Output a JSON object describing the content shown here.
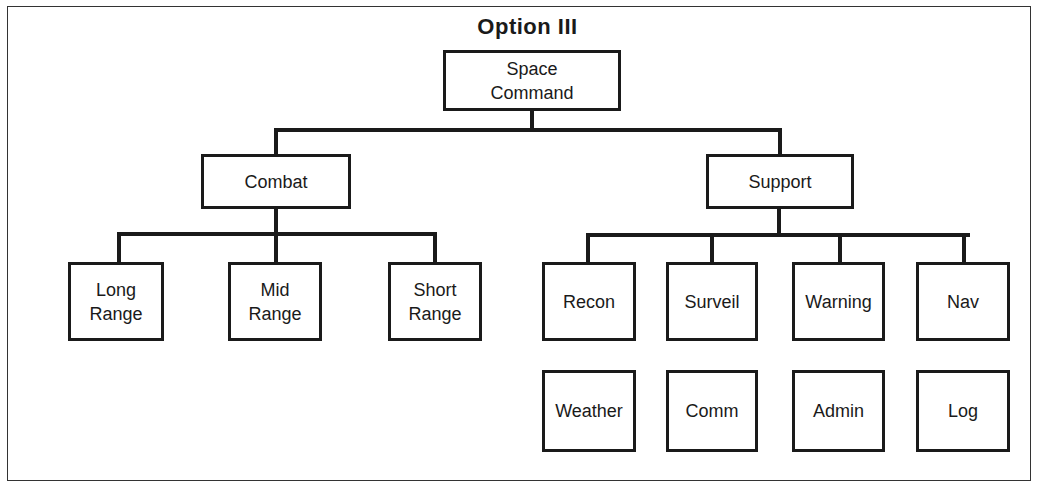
{
  "title": "Option III",
  "root": {
    "label_line1": "Space",
    "label_line2": "Command"
  },
  "branches": {
    "combat": {
      "label": "Combat",
      "children": [
        {
          "line1": "Long",
          "line2": "Range"
        },
        {
          "line1": "Mid",
          "line2": "Range"
        },
        {
          "line1": "Short",
          "line2": "Range"
        }
      ]
    },
    "support": {
      "label": "Support",
      "row1": [
        "Recon",
        "Surveil",
        "Warning",
        "Nav"
      ],
      "row2": [
        "Weather",
        "Comm",
        "Admin",
        "Log"
      ]
    }
  }
}
